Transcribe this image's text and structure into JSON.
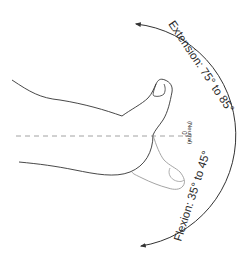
{
  "diagram": {
    "extension": {
      "label": "Extension:",
      "range": "75° to 85°",
      "full": "Extension: 75° to 85°"
    },
    "flexion": {
      "label": "Flexion:",
      "range": "35° to 45°",
      "full": "Flexion: 35° to 45°"
    },
    "neutral": {
      "angle": "0°",
      "label": "(Neutral)"
    },
    "colors": {
      "outline_dark": "#333333",
      "outline_light": "#9a9a9a",
      "dashed_line": "#8a8a8a",
      "arc": "#333333",
      "background": "#ffffff"
    }
  }
}
